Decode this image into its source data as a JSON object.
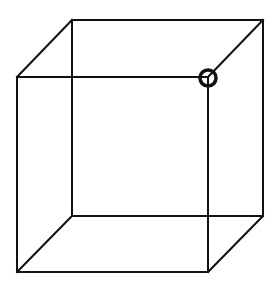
{
  "diagram": {
    "type": "wireframe-cube (Necker cube)",
    "colors": {
      "background": "#ffffff",
      "stroke": "#111111"
    },
    "vertices": {
      "back_top_left": [
        72,
        20
      ],
      "back_top_right": [
        263,
        20
      ],
      "back_bottom_left": [
        72,
        216
      ],
      "back_bottom_right": [
        263,
        216
      ],
      "front_top_left": [
        17,
        77
      ],
      "front_top_right": [
        208,
        77
      ],
      "front_bottom_left": [
        17,
        272
      ],
      "front_bottom_right": [
        208,
        272
      ]
    },
    "highlight": {
      "label": "highlighted vertex",
      "vertex": "front_top_right",
      "center": [
        208,
        78
      ],
      "radius": 8
    }
  }
}
